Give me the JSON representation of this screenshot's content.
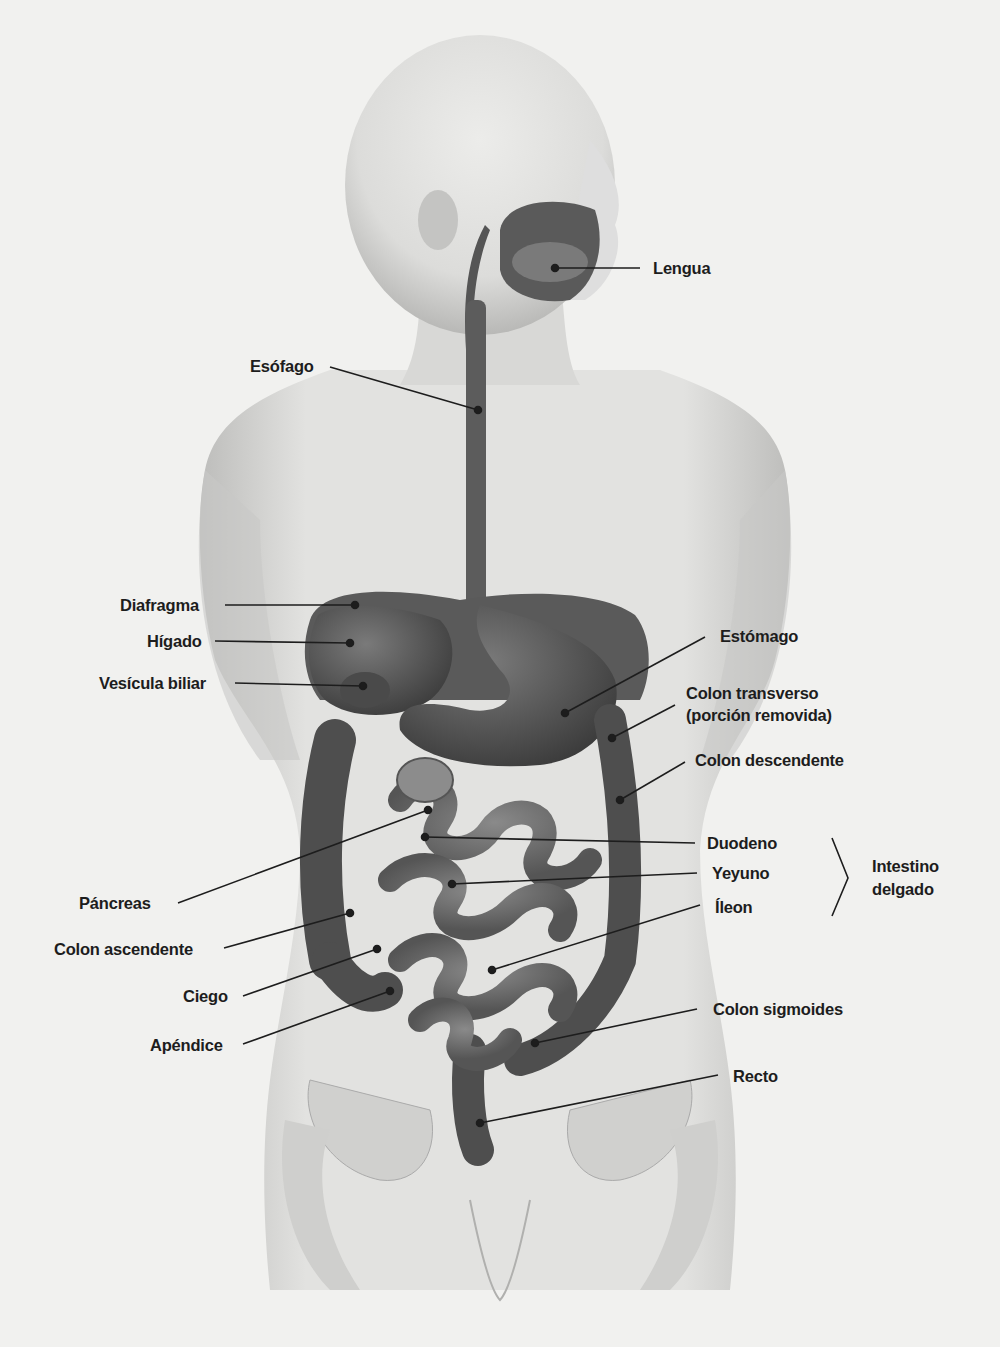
{
  "figure": {
    "colors": {
      "background": "#f1f1ef",
      "skin_light": "#e6e6e4",
      "skin_shadow": "#b4b4b2",
      "organ_dark": "#4a4a4a",
      "organ_mid": "#6a6a6a",
      "leader_line": "#1d1d1d",
      "text": "#1d1d1d"
    }
  },
  "labels": {
    "lengua": "Lengua",
    "esofago": "Esófago",
    "diafragma": "Diafragma",
    "higado": "Hígado",
    "vesicula": "Vesícula biliar",
    "estomago": "Estómago",
    "colon_transverso_1": "Colon transverso",
    "colon_transverso_2": "(porción removida)",
    "colon_descendente": "Colon descendente",
    "duodeno": "Duodeno",
    "yeyuno": "Yeyuno",
    "ileon": "Íleon",
    "intestino_delgado_1": "Intestino",
    "intestino_delgado_2": "delgado",
    "pancreas": "Páncreas",
    "colon_ascendente": "Colon ascendente",
    "ciego": "Ciego",
    "apendice": "Apéndice",
    "colon_sigmoides": "Colon sigmoides",
    "recto": "Recto"
  }
}
